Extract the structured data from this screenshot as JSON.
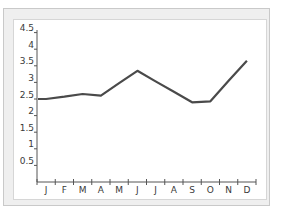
{
  "chart_data": {
    "type": "line",
    "title": "",
    "xlabel": "",
    "ylabel": "",
    "categories": [
      "J",
      "F",
      "M",
      "A",
      "M",
      "J",
      "J",
      "A",
      "S",
      "O",
      "N",
      "D"
    ],
    "series": [
      {
        "name": "Series 1",
        "values": [
          2.5,
          2.57,
          2.65,
          2.6,
          2.98,
          3.35,
          3.03,
          2.72,
          2.4,
          2.43,
          3.05,
          3.65
        ],
        "color": "#4a4a4a"
      }
    ],
    "yticks": [
      "0.5",
      "1",
      "1.5",
      "2",
      "2.5",
      "3",
      "3.5",
      "4",
      "4.5"
    ],
    "ylim": [
      0,
      4.8
    ],
    "grid": false,
    "legend": "none"
  },
  "colors": {
    "line": "#4a4a4a",
    "axis": "#555555",
    "frame": "#c9c9c9",
    "frame_fill": "#efefef"
  }
}
